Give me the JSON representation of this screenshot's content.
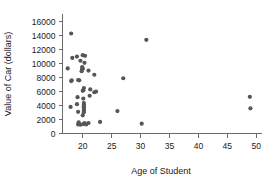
{
  "chart_data": {
    "type": "scatter",
    "title": "",
    "xlabel": "Age of Student",
    "ylabel": "Value of Car (dollars)",
    "xlim": [
      16.5,
      51
    ],
    "ylim": [
      0,
      16800
    ],
    "grid": false,
    "legend": null,
    "xticks": [
      20,
      25,
      30,
      35,
      40,
      45,
      50
    ],
    "xtick_labels": [
      "20",
      "25",
      "30",
      "35",
      "40",
      "45",
      "50"
    ],
    "yticks": [
      0,
      2000,
      4000,
      6000,
      8000,
      10000,
      12000,
      14000,
      16000
    ],
    "ytick_labels": [
      "0",
      "2000",
      "4000",
      "6000",
      "8000",
      "10000",
      "12000",
      "14000",
      "16000"
    ],
    "marker": "circle",
    "marker_color": "#565656",
    "marker_size": 2.1,
    "points": [
      {
        "x": 18.0,
        "y": 14300
      },
      {
        "x": 17.4,
        "y": 9300
      },
      {
        "x": 18.2,
        "y": 10800
      },
      {
        "x": 18.1,
        "y": 7600
      },
      {
        "x": 18.0,
        "y": 7500
      },
      {
        "x": 17.9,
        "y": 3800
      },
      {
        "x": 19.0,
        "y": 11000
      },
      {
        "x": 19.6,
        "y": 10400
      },
      {
        "x": 19.9,
        "y": 9500
      },
      {
        "x": 19.9,
        "y": 9200
      },
      {
        "x": 19.8,
        "y": 8900
      },
      {
        "x": 19.2,
        "y": 7650
      },
      {
        "x": 19.4,
        "y": 7600
      },
      {
        "x": 19.1,
        "y": 5200
      },
      {
        "x": 19.0,
        "y": 4200
      },
      {
        "x": 19.2,
        "y": 3100
      },
      {
        "x": 19.3,
        "y": 1600
      },
      {
        "x": 19.2,
        "y": 1300
      },
      {
        "x": 19.6,
        "y": 1250
      },
      {
        "x": 20.0,
        "y": 11200
      },
      {
        "x": 20.4,
        "y": 11100
      },
      {
        "x": 20.3,
        "y": 10100
      },
      {
        "x": 20.0,
        "y": 9300
      },
      {
        "x": 20.2,
        "y": 6500
      },
      {
        "x": 20.1,
        "y": 6200
      },
      {
        "x": 20.0,
        "y": 6100
      },
      {
        "x": 20.1,
        "y": 5000
      },
      {
        "x": 20.2,
        "y": 4350
      },
      {
        "x": 20.2,
        "y": 4100
      },
      {
        "x": 20.2,
        "y": 3900
      },
      {
        "x": 20.2,
        "y": 3700
      },
      {
        "x": 20.2,
        "y": 3500
      },
      {
        "x": 20.2,
        "y": 3300
      },
      {
        "x": 20.2,
        "y": 3050
      },
      {
        "x": 20.0,
        "y": 2600
      },
      {
        "x": 20.3,
        "y": 1500
      },
      {
        "x": 20.1,
        "y": 1350
      },
      {
        "x": 20.6,
        "y": 1300
      },
      {
        "x": 21.0,
        "y": 9000
      },
      {
        "x": 21.3,
        "y": 6300
      },
      {
        "x": 21.2,
        "y": 5400
      },
      {
        "x": 21.0,
        "y": 1500
      },
      {
        "x": 22.0,
        "y": 8400
      },
      {
        "x": 22.3,
        "y": 6000
      },
      {
        "x": 22.0,
        "y": 5900
      },
      {
        "x": 23.0,
        "y": 1650
      },
      {
        "x": 26.0,
        "y": 3200
      },
      {
        "x": 27.0,
        "y": 7900
      },
      {
        "x": 30.2,
        "y": 1400
      },
      {
        "x": 31.0,
        "y": 13400
      },
      {
        "x": 48.9,
        "y": 5250
      },
      {
        "x": 49.0,
        "y": 3600
      }
    ]
  }
}
